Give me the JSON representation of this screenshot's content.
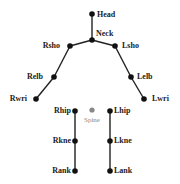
{
  "diagram": {
    "type": "skeleton-keypoints",
    "colors": {
      "bone": "#222222",
      "joint": "#111111",
      "spine": "#888888",
      "background": "#ffffff"
    },
    "joints": [
      {
        "id": "head",
        "label": "Head",
        "x": 92,
        "y": 14,
        "label_x": 97,
        "label_y": 17,
        "anchor": "start"
      },
      {
        "id": "neck",
        "label": "Neck",
        "x": 92,
        "y": 40,
        "label_x": 96,
        "label_y": 36,
        "anchor": "start"
      },
      {
        "id": "rsho",
        "label": "Rsho",
        "x": 70,
        "y": 46,
        "label_x": 60,
        "label_y": 48,
        "anchor": "end"
      },
      {
        "id": "lsho",
        "label": "Lsho",
        "x": 115,
        "y": 46,
        "label_x": 122,
        "label_y": 48,
        "anchor": "start"
      },
      {
        "id": "relb",
        "label": "Relb",
        "x": 54,
        "y": 77,
        "label_x": 43,
        "label_y": 79,
        "anchor": "end"
      },
      {
        "id": "lelb",
        "label": "Lelb",
        "x": 131,
        "y": 77,
        "label_x": 137,
        "label_y": 79,
        "anchor": "start"
      },
      {
        "id": "rwri",
        "label": "Rwri",
        "x": 36,
        "y": 99,
        "label_x": 27,
        "label_y": 101,
        "anchor": "end"
      },
      {
        "id": "lwri",
        "label": "Lwri",
        "x": 144,
        "y": 99,
        "label_x": 152,
        "label_y": 101,
        "anchor": "start"
      },
      {
        "id": "rhip",
        "label": "Rhip",
        "x": 75,
        "y": 111,
        "label_x": 71,
        "label_y": 113,
        "anchor": "end"
      },
      {
        "id": "lhip",
        "label": "Lhip",
        "x": 110,
        "y": 111,
        "label_x": 114,
        "label_y": 113,
        "anchor": "start"
      },
      {
        "id": "rkne",
        "label": "Rkne",
        "x": 75,
        "y": 141,
        "label_x": 71,
        "label_y": 143,
        "anchor": "end"
      },
      {
        "id": "lkne",
        "label": "Lkne",
        "x": 110,
        "y": 141,
        "label_x": 114,
        "label_y": 143,
        "anchor": "start"
      },
      {
        "id": "rank",
        "label": "Rank",
        "x": 75,
        "y": 171,
        "label_x": 71,
        "label_y": 173,
        "anchor": "end"
      },
      {
        "id": "lank",
        "label": "Lank",
        "x": 110,
        "y": 171,
        "label_x": 114,
        "label_y": 173,
        "anchor": "start"
      }
    ],
    "spine": {
      "label": "Spine",
      "x": 92,
      "y": 110,
      "label_x": 92,
      "label_y": 122
    },
    "bones": [
      [
        "head",
        "neck"
      ],
      [
        "neck",
        "rsho"
      ],
      [
        "neck",
        "lsho"
      ],
      [
        "rsho",
        "relb"
      ],
      [
        "relb",
        "rwri"
      ],
      [
        "lsho",
        "lelb"
      ],
      [
        "lelb",
        "lwri"
      ],
      [
        "rhip",
        "rkne"
      ],
      [
        "rkne",
        "rank"
      ],
      [
        "lhip",
        "lkne"
      ],
      [
        "lkne",
        "lank"
      ]
    ]
  }
}
